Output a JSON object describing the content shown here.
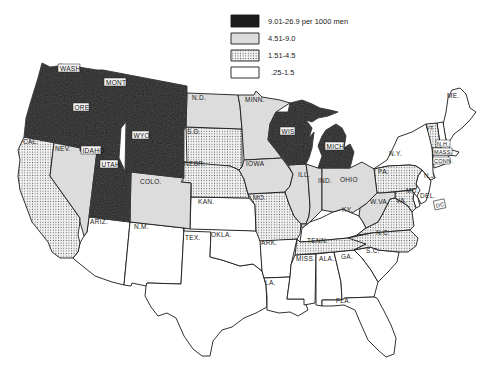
{
  "legend": {
    "items": [
      {
        "label": "9.01-26.9  per 1000 men",
        "class": "c4",
        "fill": "#1c1c1c"
      },
      {
        "label": "4.51-9.0",
        "class": "c3",
        "fill": "#dcdcdc"
      },
      {
        "label": "1.51-4.5",
        "class": "c2",
        "fill": "dots"
      },
      {
        "label": ".25-1.5",
        "class": "c1",
        "fill": "#ffffff"
      }
    ]
  },
  "colors": {
    "c4": "#1c1c1c",
    "c3": "#dcdcdc",
    "c2_bg": "#f2f2f2",
    "c2_dot": "#6a6a6a",
    "c1": "#ffffff",
    "stroke": "#1a1a1a"
  },
  "states": {
    "WASH": {
      "label": "WASH.",
      "class": "c4"
    },
    "ORE": {
      "label": "ORE.",
      "class": "c4"
    },
    "IDAHO": {
      "label": "IDAHO",
      "class": "c4"
    },
    "MONT": {
      "label": "MONT.",
      "class": "c4"
    },
    "WYO": {
      "label": "WYO.",
      "class": "c4"
    },
    "UTAH": {
      "label": "UTAH",
      "class": "c4"
    },
    "WIS": {
      "label": "WIS.",
      "class": "c4"
    },
    "MICH": {
      "label": "MICH.",
      "class": "c4"
    },
    "NEV": {
      "label": "NEV.",
      "class": "c3"
    },
    "COLO": {
      "label": "COLO.",
      "class": "c3"
    },
    "ND": {
      "label": "N.D.",
      "class": "c3"
    },
    "MINN": {
      "label": "MINN.",
      "class": "c3"
    },
    "IOWA": {
      "label": "IOWA",
      "class": "c3"
    },
    "ILL": {
      "label": "ILL.",
      "class": "c3"
    },
    "IND": {
      "label": "IND.",
      "class": "c3"
    },
    "OHIO": {
      "label": "OHIO",
      "class": "c3"
    },
    "WVA": {
      "label": "W.VA.",
      "class": "c3"
    },
    "CAL": {
      "label": "CAL.",
      "class": "c2"
    },
    "SD": {
      "label": "S.D.",
      "class": "c2"
    },
    "NEBR": {
      "label": "NEBR.",
      "class": "c2"
    },
    "MO": {
      "label": "MO.",
      "class": "c2"
    },
    "TENN": {
      "label": "TENN.",
      "class": "c2"
    },
    "VA": {
      "label": "VA.",
      "class": "c2"
    },
    "NC": {
      "label": "N.C.",
      "class": "c2"
    },
    "PA": {
      "label": "PA.",
      "class": "c2"
    },
    "VT": {
      "label": "VT.",
      "class": "c2"
    },
    "MD": {
      "label": "MD.",
      "class": "c2"
    },
    "ARIZ": {
      "label": "ARIZ.",
      "class": "c1"
    },
    "NM": {
      "label": "N.M.",
      "class": "c1"
    },
    "TEX": {
      "label": "TEX.",
      "class": "c1"
    },
    "OKLA": {
      "label": "OKLA.",
      "class": "c1"
    },
    "KAN": {
      "label": "KAN.",
      "class": "c1"
    },
    "ARK": {
      "label": "ARK.",
      "class": "c1"
    },
    "LA": {
      "label": "LA.",
      "class": "c1"
    },
    "MISS": {
      "label": "MISS.",
      "class": "c1"
    },
    "ALA": {
      "label": "ALA.",
      "class": "c1"
    },
    "GA": {
      "label": "GA.",
      "class": "c1"
    },
    "FLA": {
      "label": "FLA.",
      "class": "c1"
    },
    "SC": {
      "label": "S.C.",
      "class": "c1"
    },
    "KY": {
      "label": "KY.",
      "class": "c1"
    },
    "NY": {
      "label": "N.Y.",
      "class": "c1"
    },
    "NJ": {
      "label": "N.J.",
      "class": "c1"
    },
    "DEL": {
      "label": "DEL.",
      "class": "c1"
    },
    "ME": {
      "label": "ME.",
      "class": "c1"
    },
    "NH": {
      "label": "N.H.",
      "class": "c1"
    },
    "MASS": {
      "label": "MASS.",
      "class": "c1"
    },
    "CONN": {
      "label": "CONN.",
      "class": "c1"
    },
    "DC": {
      "label": "DC",
      "class": "c1"
    }
  }
}
